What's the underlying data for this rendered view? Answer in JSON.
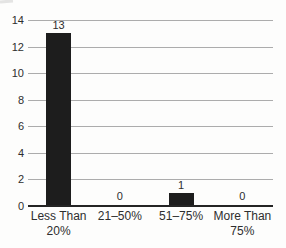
{
  "chart_data": {
    "type": "bar",
    "categories": [
      "Less Than 20%",
      "21–50%",
      "51–75%",
      "More Than 75%"
    ],
    "category_lines": [
      [
        "Less Than",
        "20%"
      ],
      [
        "21–50%"
      ],
      [
        "51–75%"
      ],
      [
        "More Than",
        "75%"
      ]
    ],
    "values": [
      13,
      0,
      1,
      0
    ],
    "value_labels": [
      "13",
      "0",
      "1",
      "0"
    ],
    "title": "",
    "xlabel": "",
    "ylabel": "",
    "ylim": [
      0,
      14
    ],
    "yticks": [
      0,
      2,
      4,
      6,
      8,
      10,
      12,
      14
    ],
    "grid": true,
    "legend": false,
    "bar_color": "#1d1d1d",
    "gridline_color": "#acacac",
    "axis_color": "#242424",
    "text_color": "#2e2e2e",
    "background_color": "#fdfdfc"
  }
}
